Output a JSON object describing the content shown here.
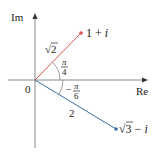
{
  "diagram": {
    "axes": {
      "x_label": "Re",
      "y_label": "Im",
      "origin_label": "0",
      "color": "#888888"
    },
    "vectors": [
      {
        "name": "1+i",
        "label_main": "1 + ",
        "label_i": "i",
        "modulus_label_root": "√",
        "modulus_label_num": "2",
        "angle_label_num": "π",
        "angle_label_den": "4",
        "angle_sign": "",
        "color": "#d9534f"
      },
      {
        "name": "√3−i",
        "label_root": "√",
        "label_num": "3",
        "label_minus": " − ",
        "label_i": "i",
        "modulus_label": "2",
        "angle_label_num": "π",
        "angle_label_den": "6",
        "angle_sign": "−",
        "color": "#3a6ea5"
      }
    ]
  }
}
